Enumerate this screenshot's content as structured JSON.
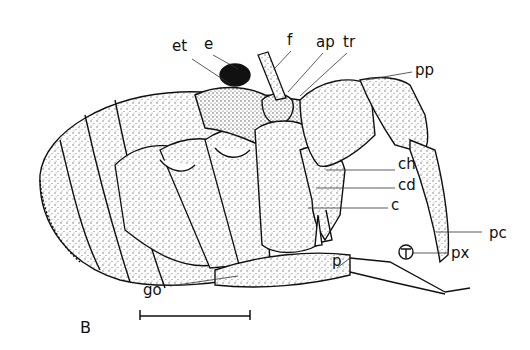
{
  "figure": {
    "panel_label": "B",
    "scale_bar": true
  },
  "labels": {
    "et": "et",
    "e": "e",
    "f": "f",
    "ap": "ap",
    "tr": "tr",
    "pp": "pp",
    "ch": "ch",
    "cd": "cd",
    "c": "c",
    "pc": "pc",
    "px": "px",
    "p": "p",
    "go": "go"
  },
  "colors": {
    "ink": "#111111",
    "paper": "#ffffff",
    "stipple": "#555555"
  }
}
